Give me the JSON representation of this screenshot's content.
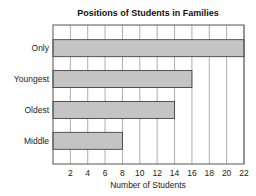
{
  "chart_data": {
    "type": "bar",
    "orientation": "horizontal",
    "title": "Positions of Students in Families",
    "xlabel": "Number of Students",
    "ylabel": "",
    "categories": [
      "Only",
      "Youngest",
      "Oldest",
      "Middle"
    ],
    "values": [
      22,
      16,
      14,
      8
    ],
    "xlim": [
      0,
      22
    ],
    "xticks": [
      2,
      4,
      6,
      8,
      10,
      12,
      14,
      16,
      18,
      20,
      22
    ],
    "grid": true,
    "legend": null,
    "colors": {
      "bar_fill": "#c4c4c4",
      "bar_stroke": "#444444",
      "grid": "#8a8a8a"
    }
  }
}
